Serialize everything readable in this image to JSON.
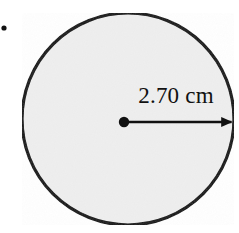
{
  "figure": {
    "background_color": "#ffffff",
    "canvas": {
      "width": 239,
      "height": 233
    }
  },
  "bullet_marker": {
    "name": "item-bullet",
    "x": 4,
    "y": 28,
    "radius": 2.6,
    "color": "#111111"
  },
  "circle": {
    "center_x": 128,
    "center_y": 119,
    "radius": 106,
    "fill_color": "#eeeeee",
    "stroke_color": "#111111",
    "stroke_width": 3.2
  },
  "center_point": {
    "x": 124,
    "y": 122,
    "radius": 5.2,
    "color": "#111111"
  },
  "radius_arrow": {
    "start_x": 124,
    "start_y": 122,
    "end_x": 233,
    "end_y": 122,
    "stroke_color": "#111111",
    "stroke_width": 2.6,
    "arrowhead_length": 11,
    "arrowhead_width": 11
  },
  "radius_label": {
    "text": "2.70 cm",
    "value": 2.7,
    "unit": "cm",
    "x": 176,
    "y": 103,
    "font_size": 23,
    "color": "#111111"
  }
}
